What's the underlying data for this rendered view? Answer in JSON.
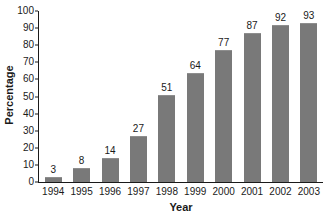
{
  "chart_data": {
    "type": "bar",
    "title": "",
    "xlabel": "Year",
    "ylabel": "Percentage",
    "categories": [
      "1994",
      "1995",
      "1996",
      "1997",
      "1998",
      "1999",
      "2000",
      "2001",
      "2002",
      "2003"
    ],
    "values": [
      3,
      8,
      14,
      27,
      51,
      64,
      77,
      87,
      92,
      93
    ],
    "value_labels": [
      "3",
      "8",
      "14",
      "27",
      "51",
      "64",
      "77",
      "87",
      "92",
      "93"
    ],
    "ylim": [
      0,
      100
    ],
    "ytick_labels": [
      "0",
      "10",
      "20",
      "30",
      "40",
      "50",
      "60",
      "70",
      "80",
      "90",
      "100"
    ],
    "ytick_values": [
      0,
      10,
      20,
      30,
      40,
      50,
      60,
      70,
      80,
      90,
      100
    ],
    "grid": false,
    "legend": false,
    "bar_color": "#797979",
    "axis_color": "#1a1a1a",
    "background_color": "#ffffff"
  }
}
